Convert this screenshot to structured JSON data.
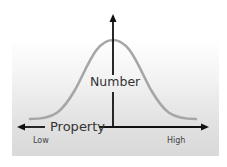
{
  "diagram": {
    "type": "bell-curve-distribution",
    "y_axis_label": "Number",
    "x_axis_label": "Property",
    "x_axis_low_label": "Low",
    "x_axis_high_label": "High",
    "colors": {
      "curve": "#a6a6a6",
      "axes": "#111111",
      "background_top": "#ffffff",
      "background_bottom": "#d9d9d9",
      "text": "#333333"
    }
  }
}
